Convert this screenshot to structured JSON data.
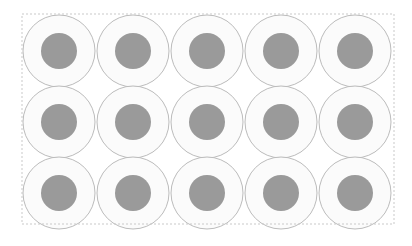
{
  "figure": {
    "type": "circle-grid-diagram",
    "canvas": {
      "width": 412,
      "height": 246,
      "background_color": "#ffffff"
    },
    "border": {
      "name": "dashed-bounding-box",
      "style": "dashed",
      "color": "#c9c9c9",
      "stroke_width": 1,
      "dash_length": 2,
      "dash_gap": 2,
      "x": 22,
      "y": 14,
      "width": 372,
      "height": 210,
      "fill": "none"
    },
    "grid": {
      "columns": 5,
      "rows": 3,
      "count": 15,
      "column_spacing": 74,
      "row_spacing": 71,
      "origin_x": 59,
      "origin_y": 51
    },
    "circle_style": {
      "outer_radius": 36,
      "outer_fill": "#fbfbfb",
      "outer_stroke": "#bcbcbc",
      "outer_stroke_width": 1,
      "inner_radius": 18,
      "inner_fill": "#9a9a9a",
      "inner_stroke": "none"
    },
    "circles": [
      {
        "id": "circle-r1-c1",
        "row": 1,
        "col": 1,
        "cx": 59,
        "cy": 51
      },
      {
        "id": "circle-r1-c2",
        "row": 1,
        "col": 2,
        "cx": 133,
        "cy": 51
      },
      {
        "id": "circle-r1-c3",
        "row": 1,
        "col": 3,
        "cx": 207,
        "cy": 51
      },
      {
        "id": "circle-r1-c4",
        "row": 1,
        "col": 4,
        "cx": 281,
        "cy": 51
      },
      {
        "id": "circle-r1-c5",
        "row": 1,
        "col": 5,
        "cx": 355,
        "cy": 51
      },
      {
        "id": "circle-r2-c1",
        "row": 2,
        "col": 1,
        "cx": 59,
        "cy": 122
      },
      {
        "id": "circle-r2-c2",
        "row": 2,
        "col": 2,
        "cx": 133,
        "cy": 122
      },
      {
        "id": "circle-r2-c3",
        "row": 2,
        "col": 3,
        "cx": 207,
        "cy": 122
      },
      {
        "id": "circle-r2-c4",
        "row": 2,
        "col": 4,
        "cx": 281,
        "cy": 122
      },
      {
        "id": "circle-r2-c5",
        "row": 2,
        "col": 5,
        "cx": 355,
        "cy": 122
      },
      {
        "id": "circle-r3-c1",
        "row": 3,
        "col": 1,
        "cx": 59,
        "cy": 193
      },
      {
        "id": "circle-r3-c2",
        "row": 3,
        "col": 2,
        "cx": 133,
        "cy": 193
      },
      {
        "id": "circle-r3-c3",
        "row": 3,
        "col": 3,
        "cx": 207,
        "cy": 193
      },
      {
        "id": "circle-r3-c4",
        "row": 3,
        "col": 4,
        "cx": 281,
        "cy": 193
      },
      {
        "id": "circle-r3-c5",
        "row": 3,
        "col": 5,
        "cx": 355,
        "cy": 193
      }
    ]
  }
}
